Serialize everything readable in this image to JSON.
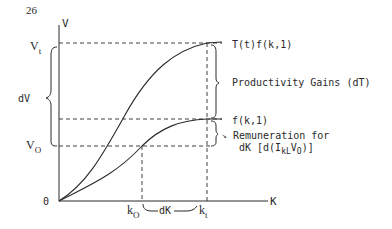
{
  "page_number": "26",
  "axes": {
    "y_label": "V",
    "x_label": "K",
    "origin_label": "0"
  },
  "y_ticks": {
    "vt": {
      "main": "V",
      "sub": "t"
    },
    "v0": {
      "main": "V",
      "sub": "O"
    },
    "dv": "dV"
  },
  "x_ticks": {
    "k0": {
      "main": "k",
      "sub": "O"
    },
    "kt": {
      "main": "k",
      "sub": "t"
    },
    "dk": "dK"
  },
  "curves": {
    "upper": "T(t)f(k,1)",
    "lower": "f(k,1)"
  },
  "annotations": {
    "productivity": "Productivity Gains (dT)",
    "remuneration_line1": "Remuneration for",
    "remuneration_line2_prefix": "dK [d(I",
    "remuneration_sub": "kL",
    "remuneration_mid": "V",
    "remuneration_sub2": "O",
    "remuneration_suffix": ")]"
  },
  "colors": {
    "ink": "#2a2a2a",
    "background": "#ffffff"
  }
}
